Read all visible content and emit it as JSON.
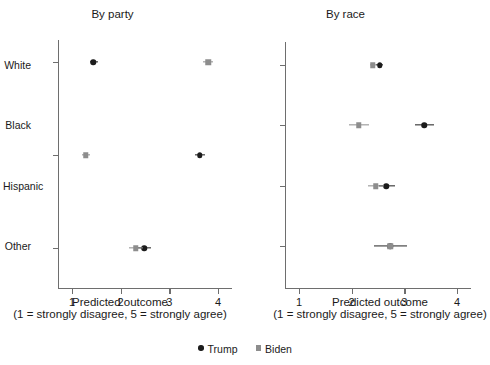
{
  "chart_data": {
    "type": "scatter",
    "title": "",
    "xlabel": "Predicted outcome",
    "xlabel_line2": "(1 = strongly disagree, 5 = strongly agree)",
    "ylabel": "",
    "xlim": [
      0.6,
      4.35
    ],
    "xticks": [
      1,
      2,
      3,
      4
    ],
    "xticklabels": [
      "1",
      "2",
      "3",
      "4"
    ],
    "grid": false,
    "legend_position": "bottom-center",
    "legend": [
      {
        "name": "Trump",
        "marker": "circle",
        "color": "#1c1c1c"
      },
      {
        "name": "Biden",
        "marker": "square",
        "color": "#8d8d8d"
      }
    ],
    "panels": [
      {
        "id": "party",
        "title": "By party",
        "categories": [
          "Republican",
          "Democrat",
          "Other"
        ],
        "series": [
          {
            "name": "Trump",
            "marker": "circle",
            "color": "#1c1c1c",
            "points": [
              {
                "category": "Republican",
                "value": 1.44,
                "ci_low": 1.36,
                "ci_high": 1.53
              },
              {
                "category": "Democrat",
                "value": 3.63,
                "ci_low": 3.52,
                "ci_high": 3.74
              },
              {
                "category": "Other",
                "value": 2.48,
                "ci_low": 2.33,
                "ci_high": 2.63
              }
            ]
          },
          {
            "name": "Biden",
            "marker": "square",
            "color": "#8d8d8d",
            "points": [
              {
                "category": "Republican",
                "value": 3.8,
                "ci_low": 3.7,
                "ci_high": 3.9
              },
              {
                "category": "Democrat",
                "value": 1.28,
                "ci_low": 1.2,
                "ci_high": 1.37
              },
              {
                "category": "Other",
                "value": 2.31,
                "ci_low": 2.17,
                "ci_high": 2.45
              }
            ]
          }
        ]
      },
      {
        "id": "race",
        "title": "By race",
        "categories": [
          "White",
          "Black",
          "Hispanic",
          "Other"
        ],
        "series": [
          {
            "name": "Trump",
            "marker": "circle",
            "color": "#1c1c1c",
            "points": [
              {
                "category": "White",
                "value": 2.53,
                "ci_low": 2.47,
                "ci_high": 2.6
              },
              {
                "category": "Black",
                "value": 3.38,
                "ci_low": 3.2,
                "ci_high": 3.57
              },
              {
                "category": "Hispanic",
                "value": 2.66,
                "ci_low": 2.51,
                "ci_high": 2.82
              },
              {
                "category": "Other",
                "value": 2.73,
                "ci_low": 2.42,
                "ci_high": 3.05
              }
            ]
          },
          {
            "name": "Biden",
            "marker": "square",
            "color": "#8d8d8d",
            "points": [
              {
                "category": "White",
                "value": 2.4,
                "ci_low": 2.34,
                "ci_high": 2.46
              },
              {
                "category": "Black",
                "value": 2.13,
                "ci_low": 1.94,
                "ci_high": 2.33
              },
              {
                "category": "Hispanic",
                "value": 2.46,
                "ci_low": 2.31,
                "ci_high": 2.62
              },
              {
                "category": "Other",
                "value": 2.73,
                "ci_low": 2.42,
                "ci_high": 3.05
              }
            ]
          }
        ]
      }
    ]
  }
}
